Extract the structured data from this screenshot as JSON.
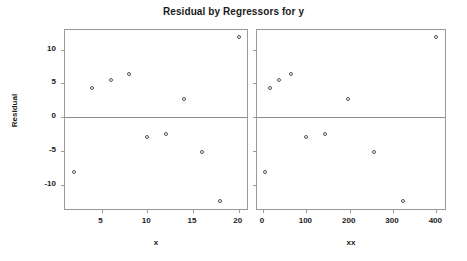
{
  "chart_data": [
    {
      "type": "scatter",
      "title": "Residual by Regressors for y",
      "panel_id": "left",
      "xlabel": "x",
      "ylabel": "Residual",
      "xlim": [
        1.0,
        20.9
      ],
      "ylim": [
        -13.6,
        12.9
      ],
      "xticks": [
        5,
        10,
        15,
        20
      ],
      "yticks": [
        10,
        5,
        0,
        -5,
        -10
      ],
      "xticklabels": [
        "5",
        "10",
        "15",
        "20"
      ],
      "yticklabels": [
        "10",
        "5",
        "0",
        "-5",
        "-10"
      ],
      "grid": false,
      "legend": false,
      "reference_line_y": 0,
      "marker": "open-circle",
      "x": [
        2,
        4,
        6,
        8,
        10,
        12,
        14,
        16,
        18,
        20
      ],
      "y": [
        -8.1,
        4.3,
        5.5,
        6.4,
        -2.9,
        -2.5,
        2.7,
        -5.2,
        -12.4,
        11.8
      ]
    },
    {
      "type": "scatter",
      "title": "Residual by Regressors for y",
      "panel_id": "right",
      "xlabel": "xx",
      "ylabel": "Residual",
      "xlim": [
        -14,
        420
      ],
      "ylim": [
        -13.6,
        12.9
      ],
      "xticks": [
        0,
        100,
        200,
        300,
        400
      ],
      "yticks": [
        10,
        5,
        0,
        -5,
        -10
      ],
      "xticklabels": [
        "0",
        "100",
        "200",
        "300",
        "400"
      ],
      "yticklabels": [
        "10",
        "5",
        "0",
        "-5",
        "-10"
      ],
      "grid": false,
      "legend": false,
      "reference_line_y": 0,
      "marker": "open-circle",
      "x": [
        4,
        16,
        36,
        64,
        100,
        144,
        196,
        256,
        324,
        400
      ],
      "y": [
        -8.1,
        4.3,
        5.5,
        6.4,
        -2.9,
        -2.5,
        2.7,
        -5.2,
        -12.4,
        11.8
      ]
    }
  ],
  "header": {
    "title": "Residual by Regressors for y"
  },
  "axes": {
    "y_title": "Residual",
    "x_title_left": "x",
    "x_title_right": "xx"
  }
}
